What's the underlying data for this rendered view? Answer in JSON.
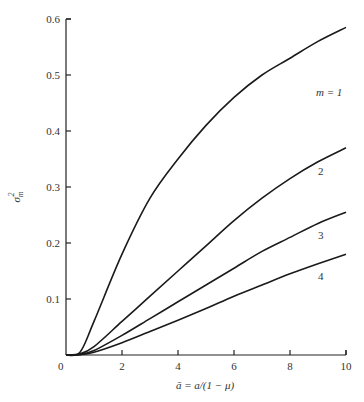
{
  "chart_data": {
    "type": "line",
    "title": "",
    "xlabel": "ā = a/(1 − μ)",
    "ylabel": "σ²ₘ",
    "xlim": [
      0,
      10
    ],
    "ylim": [
      0,
      0.6
    ],
    "x_ticks": [
      "0",
      "2",
      "4",
      "6",
      "8",
      "10"
    ],
    "y_ticks": [
      "0.1",
      "0.2",
      "0.3",
      "0.4",
      "0.5",
      "0.6"
    ],
    "grid": false,
    "legend": "inline curve labels",
    "x": [
      0,
      0.5,
      1,
      2,
      3,
      4,
      5,
      6,
      7,
      8,
      9,
      10
    ],
    "series": [
      {
        "name": "m = 1",
        "values": [
          0,
          0.005,
          0.06,
          0.18,
          0.28,
          0.35,
          0.41,
          0.46,
          0.5,
          0.53,
          0.56,
          0.585
        ]
      },
      {
        "name": "2",
        "values": [
          0,
          0.002,
          0.015,
          0.06,
          0.105,
          0.15,
          0.195,
          0.24,
          0.28,
          0.315,
          0.345,
          0.37
        ]
      },
      {
        "name": "3",
        "values": [
          0,
          0.001,
          0.008,
          0.035,
          0.065,
          0.095,
          0.125,
          0.155,
          0.185,
          0.21,
          0.235,
          0.255
        ]
      },
      {
        "name": "4",
        "values": [
          0,
          0.0005,
          0.005,
          0.022,
          0.042,
          0.062,
          0.083,
          0.105,
          0.125,
          0.145,
          0.163,
          0.18
        ]
      }
    ]
  },
  "labels": {
    "y_axis_title_sigma": "σ",
    "y_axis_title_sup": "2",
    "y_axis_title_sub": "m",
    "x_axis_title": "ā = a/(1 − μ)",
    "origin": "0",
    "curve_label_1": "m = 1",
    "curve_label_2": "2",
    "curve_label_3": "3",
    "curve_label_4": "4"
  }
}
